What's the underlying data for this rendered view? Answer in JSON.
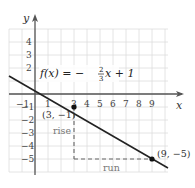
{
  "chart_data": {
    "type": "line",
    "title": "",
    "function_label": {
      "lhs": "f(x) = ",
      "sign": "−",
      "numerator": "2",
      "denominator": "3",
      "rhs": "x + 1"
    },
    "xlabel": "x",
    "ylabel": "y",
    "xlim": [
      -2,
      10
    ],
    "ylim": [
      -6,
      5
    ],
    "grid": true,
    "x_ticks": [
      "−1",
      "1",
      "3",
      "4",
      "5",
      "6",
      "7",
      "8",
      "9"
    ],
    "y_ticks": [
      "4",
      "3",
      "2",
      "−1",
      "−2",
      "−3",
      "−4",
      "−5"
    ],
    "series": [
      {
        "name": "f(x) = -2/3 x + 1",
        "slope": -0.6667,
        "intercept": 1,
        "x": [
          -2,
          10.2
        ],
        "y": [
          2.333,
          -5.8
        ]
      }
    ],
    "points": [
      {
        "x": 3,
        "y": -1,
        "label": "(3, −1)"
      },
      {
        "x": 9,
        "y": -5,
        "label": "(9, −5)"
      }
    ],
    "annotations": [
      {
        "text": "rise",
        "type": "vertical-dashed",
        "from": [
          3,
          -1
        ],
        "to": [
          3,
          -5
        ]
      },
      {
        "text": "run",
        "type": "horizontal-dashed",
        "from": [
          3,
          -5
        ],
        "to": [
          9,
          -5
        ]
      }
    ],
    "colors": {
      "line": "#222222",
      "grid": "#dddddd",
      "axis": "#555555",
      "dashed": "#666666"
    }
  }
}
